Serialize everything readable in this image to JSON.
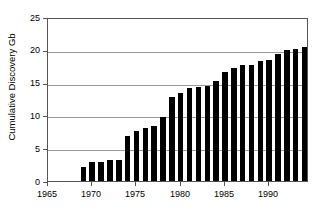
{
  "chart_data": {
    "type": "bar",
    "title": "",
    "subtitle": "",
    "xlabel": "",
    "ylabel": "Cumulative Discovery Gb",
    "xlim": [
      1965,
      1994.5
    ],
    "ylim": [
      0,
      25
    ],
    "grid": true,
    "legend": null,
    "bar_color": "#000000",
    "gridline_color": "#9a9a9a",
    "axis_color": "#555555",
    "y_ticks": [
      0,
      5,
      10,
      15,
      20,
      25
    ],
    "y_tick_labels": [
      "0",
      "5",
      "10",
      "15",
      "20",
      "25"
    ],
    "x_ticks": [
      1965,
      1970,
      1975,
      1980,
      1985,
      1990
    ],
    "x_tick_labels": [
      "1965",
      "1970",
      "1975",
      "1980",
      "1985",
      "1990"
    ],
    "categories": [
      1969,
      1970,
      1971,
      1972,
      1973,
      1974,
      1975,
      1976,
      1977,
      1978,
      1979,
      1980,
      1981,
      1982,
      1983,
      1984,
      1985,
      1986,
      1987,
      1988,
      1989,
      1990,
      1991,
      1992,
      1993,
      1994
    ],
    "values": [
      2.1,
      2.9,
      2.9,
      3.2,
      3.2,
      6.9,
      7.6,
      8.1,
      8.4,
      9.8,
      12.8,
      13.4,
      14.2,
      14.3,
      14.5,
      15.3,
      16.6,
      17.3,
      17.7,
      17.7,
      18.3,
      18.5,
      19.3,
      20.0,
      20.1,
      20.5
    ]
  }
}
